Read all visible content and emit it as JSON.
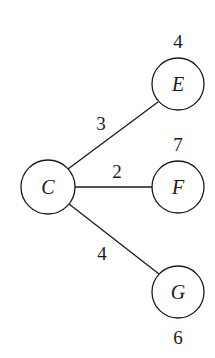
{
  "diagram": {
    "type": "tree",
    "nodes": [
      {
        "id": "C",
        "label": "C",
        "value": null
      },
      {
        "id": "E",
        "label": "E",
        "value": "4"
      },
      {
        "id": "F",
        "label": "F",
        "value": "7"
      },
      {
        "id": "G",
        "label": "G",
        "value": "6"
      }
    ],
    "edges": [
      {
        "from": "C",
        "to": "E",
        "weight": "3"
      },
      {
        "from": "C",
        "to": "F",
        "weight": "2"
      },
      {
        "from": "C",
        "to": "G",
        "weight": "4"
      }
    ]
  }
}
